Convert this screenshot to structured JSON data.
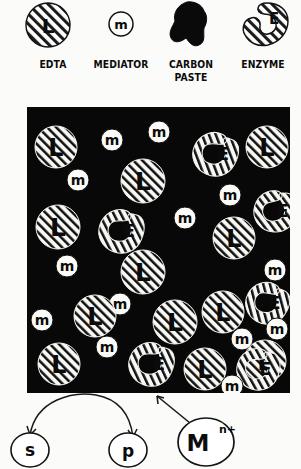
{
  "figure": {
    "kind": "schematic-diagram"
  },
  "legend": {
    "items": [
      {
        "label": "EDTA",
        "icon": "hatched-circle-L-icon",
        "symbol": "L",
        "x": 12,
        "w": 82
      },
      {
        "label": "MEDIATOR",
        "icon": "small-circle-m-icon",
        "symbol": "m",
        "x": 76,
        "w": 90
      },
      {
        "label": "CARBON\nPASTE",
        "label_line1": "CARBON",
        "label_line2": "PASTE",
        "icon": "black-blob-icon",
        "symbol": "",
        "x": 151,
        "w": 80
      },
      {
        "label": "ENZYME",
        "icon": "hatched-crescent-E-icon",
        "symbol": "E",
        "x": 225,
        "w": 76
      }
    ]
  },
  "field": {
    "name": "carbon-paste-matrix",
    "background_color": "#080808",
    "particle_fill": "#f4f4f0",
    "particle_stroke": "#101010",
    "particles": [
      {
        "t": "L",
        "cx": 29,
        "cy": 40,
        "r": 21
      },
      {
        "t": "m",
        "cx": 85,
        "cy": 33,
        "r": 11
      },
      {
        "t": "m",
        "cx": 132,
        "cy": 25,
        "r": 11
      },
      {
        "t": "E",
        "cx": 188,
        "cy": 47,
        "r": 23,
        "rot": 24
      },
      {
        "t": "L",
        "cx": 240,
        "cy": 40,
        "r": 21
      },
      {
        "t": "m",
        "cx": 51,
        "cy": 73,
        "r": 11
      },
      {
        "t": "L",
        "cx": 116,
        "cy": 74,
        "r": 22
      },
      {
        "t": "m",
        "cx": 203,
        "cy": 88,
        "r": 11
      },
      {
        "t": "E",
        "cx": 248,
        "cy": 104,
        "r": 22,
        "rot": 8
      },
      {
        "t": "L",
        "cx": 31,
        "cy": 120,
        "r": 22
      },
      {
        "t": "E",
        "cx": 94,
        "cy": 124,
        "r": 23,
        "rot": 18
      },
      {
        "t": "m",
        "cx": 158,
        "cy": 111,
        "r": 11
      },
      {
        "t": "L",
        "cx": 207,
        "cy": 131,
        "r": 21
      },
      {
        "t": "m",
        "cx": 40,
        "cy": 159,
        "r": 11
      },
      {
        "t": "L",
        "cx": 116,
        "cy": 165,
        "r": 22
      },
      {
        "t": "m",
        "cx": 248,
        "cy": 163,
        "r": 11
      },
      {
        "t": "m",
        "cx": 93,
        "cy": 197,
        "r": 11
      },
      {
        "t": "L",
        "cx": 196,
        "cy": 205,
        "r": 21
      },
      {
        "t": "E",
        "cx": 240,
        "cy": 196,
        "r": 22,
        "rot": 30
      },
      {
        "t": "m",
        "cx": 15,
        "cy": 213,
        "r": 11
      },
      {
        "t": "L",
        "cx": 68,
        "cy": 209,
        "r": 21
      },
      {
        "t": "L",
        "cx": 148,
        "cy": 215,
        "r": 22
      },
      {
        "t": "m",
        "cx": 215,
        "cy": 232,
        "r": 11
      },
      {
        "t": "m",
        "cx": 250,
        "cy": 222,
        "r": 11
      },
      {
        "t": "L",
        "cx": 238,
        "cy": 254,
        "r": 21
      },
      {
        "t": "L",
        "cx": 32,
        "cy": 257,
        "r": 21
      },
      {
        "t": "m",
        "cx": 80,
        "cy": 240,
        "r": 11
      },
      {
        "t": "E",
        "cx": 124,
        "cy": 257,
        "r": 23,
        "rot": 20
      },
      {
        "t": "L",
        "cx": 178,
        "cy": 262,
        "r": 21
      },
      {
        "t": "E",
        "cx": 231,
        "cy": 262,
        "r": 22,
        "rot": 16
      },
      {
        "t": "m",
        "cx": 205,
        "cy": 279,
        "r": 11
      }
    ]
  },
  "scheme": {
    "substrate": {
      "label": "s",
      "name": "substrate-node"
    },
    "product": {
      "label": "p",
      "name": "product-node"
    },
    "metal": {
      "label": "M",
      "superscript": "n+",
      "name": "metal-ion-node"
    },
    "arrow_reaction": "substrate-to-product-arc",
    "arrow_metal": "metal-ion-to-electrode-arrow"
  }
}
